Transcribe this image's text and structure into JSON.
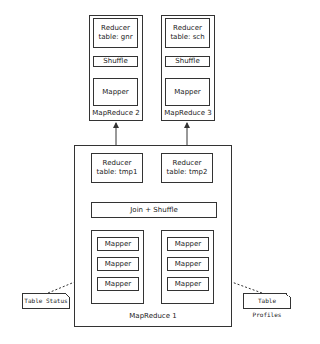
{
  "mapreduce2": {
    "title": "MapReduce 2",
    "reducer": {
      "line1": "Reducer",
      "line2": "table: gnr"
    },
    "shuffle": "Shuffle",
    "mapper": "Mapper"
  },
  "mapreduce3": {
    "title": "MapReduce 3",
    "reducer": {
      "line1": "Reducer",
      "line2": "table: sch"
    },
    "shuffle": "Shuffle",
    "mapper": "Mapper"
  },
  "mapreduce1": {
    "title": "MapReduce 1",
    "reducers": [
      {
        "line1": "Reducer",
        "line2": "table: tmp1"
      },
      {
        "line1": "Reducer",
        "line2": "table: tmp2"
      }
    ],
    "join_shuffle": "Join + Shuffle",
    "mapper_groups": [
      {
        "mappers": [
          "Mapper",
          "Mapper",
          "Mapper"
        ]
      },
      {
        "mappers": [
          "Mapper",
          "Mapper",
          "Mapper"
        ]
      }
    ]
  },
  "inputs": [
    {
      "label": "Table Status"
    },
    {
      "label": "Table Profiles"
    }
  ]
}
